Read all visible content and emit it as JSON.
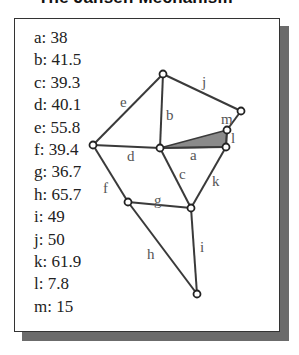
{
  "title": "The Jansen Mechanism",
  "legend": [
    {
      "key": "a",
      "value": "38"
    },
    {
      "key": "b",
      "value": "41.5"
    },
    {
      "key": "c",
      "value": "39.3"
    },
    {
      "key": "d",
      "value": "40.1"
    },
    {
      "key": "e",
      "value": "55.8"
    },
    {
      "key": "f",
      "value": "39.4"
    },
    {
      "key": "g",
      "value": "36.7"
    },
    {
      "key": "h",
      "value": "65.7"
    },
    {
      "key": "i",
      "value": "49"
    },
    {
      "key": "j",
      "value": "50"
    },
    {
      "key": "k",
      "value": "61.9"
    },
    {
      "key": "l",
      "value": "7.8"
    },
    {
      "key": "m",
      "value": "15"
    }
  ],
  "legend_text": [
    "a: 38",
    "b: 41.5",
    "c: 39.3",
    "d: 40.1",
    "e: 55.8",
    "f: 39.4",
    "g: 36.7",
    "h: 65.7",
    "i: 49",
    "j: 50",
    "k: 61.9",
    "l: 7.8",
    "m: 15"
  ],
  "link_labels": {
    "a": "a",
    "b": "b",
    "c": "c",
    "d": "d",
    "e": "e",
    "f": "f",
    "g": "g",
    "h": "h",
    "i": "i",
    "j": "j",
    "k": "k",
    "l": "l",
    "m": "m"
  },
  "colors": {
    "link": "#3a3a3a",
    "fixed_triangle_fill": "#8a8a8a",
    "shadow": "#6b6b6b",
    "label": "#555555"
  }
}
